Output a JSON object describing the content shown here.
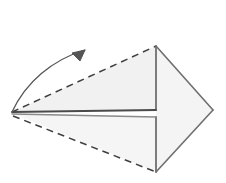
{
  "figure": {
    "title": "Paper folding step diagram",
    "caption": "",
    "background_color": "#ffffff",
    "canvas": {
      "width": 226,
      "height": 183
    }
  },
  "style": {
    "fill_light": "#f2f2f2",
    "fill_lighter": "#f7f7f7",
    "stroke_solid": "#6b6b6b",
    "stroke_solid_dark": "#4a4a4a",
    "stroke_dashed": "#3f3f3f",
    "arrow_color": "#555555",
    "stroke_width": "1.4",
    "dash_pattern": "7,5"
  },
  "geometry": {
    "vertices": {
      "left_point": {
        "x": 12,
        "y": 112,
        "label": "left-point"
      },
      "top_point": {
        "x": 156,
        "y": 46,
        "label": "top-point"
      },
      "bottom_point": {
        "x": 156,
        "y": 172,
        "label": "bottom-point"
      },
      "right_point": {
        "x": 213,
        "y": 110,
        "label": "right-point"
      },
      "mid_upper": {
        "x": 156,
        "y": 110,
        "label": "mid-upper"
      },
      "mid_lower": {
        "x": 156,
        "y": 117,
        "label": "mid-lower"
      }
    },
    "faces": [
      {
        "name": "upper-left-face",
        "points": "12,112 156,46 156,110",
        "fill": "#f1f1f1"
      },
      {
        "name": "lower-left-face",
        "points": "12,113 156,117 156,172",
        "fill": "#f5f5f5"
      },
      {
        "name": "right-face",
        "points": "156,46 213,110 156,172",
        "fill": "#f4f4f4"
      }
    ],
    "solid_edges": [
      {
        "name": "edge-top-right",
        "d": "M156,46 L213,110"
      },
      {
        "name": "edge-bottom-right",
        "d": "M213,110 L156,172"
      },
      {
        "name": "edge-spine-upper",
        "d": "M156,46 L156,110"
      },
      {
        "name": "edge-spine-lower",
        "d": "M156,117 L156,172"
      },
      {
        "name": "edge-center-upper",
        "d": "M12,112 L156,110"
      },
      {
        "name": "edge-center-lower",
        "d": "M12,114 L156,117"
      }
    ],
    "dashed_edges": [
      {
        "name": "fold-line-upper",
        "d": "M12,112 L156,46"
      },
      {
        "name": "fold-line-lower",
        "d": "M13,116 L156,172"
      }
    ],
    "arrow": {
      "name": "rotation-arrow",
      "path": "M12,112 C 26,82 52,60 85,50",
      "head": "M85,50 L72,53 L80,61 Z",
      "direction": "counter-clockwise-up-right"
    }
  },
  "labels": {
    "items": []
  }
}
